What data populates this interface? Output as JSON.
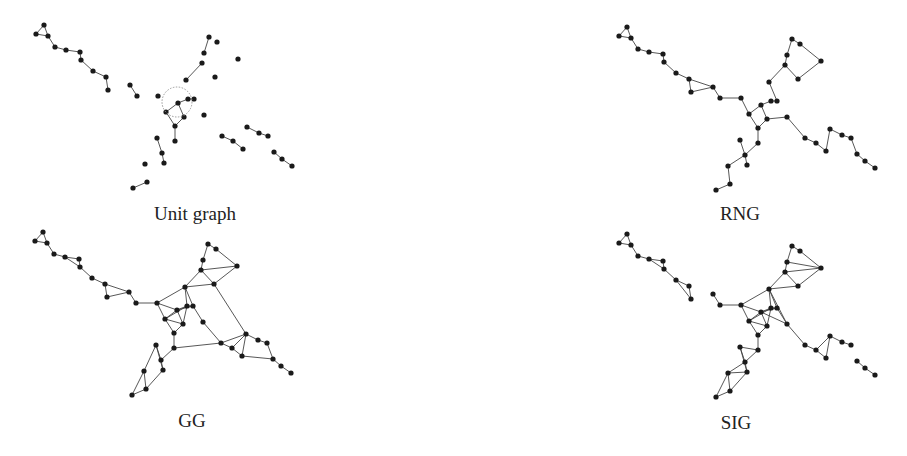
{
  "panels": [
    {
      "id": "unit",
      "label": "Unit graph",
      "label_pos": [
        195,
        203
      ],
      "offset": [
        -583,
        -2
      ]
    },
    {
      "id": "rng",
      "label": "RNG",
      "label_pos": [
        740,
        203
      ],
      "offset": [
        0,
        0
      ]
    },
    {
      "id": "gg",
      "label": "GG",
      "label_pos": [
        192,
        410
      ],
      "offset": [
        -584,
        205
      ]
    },
    {
      "id": "sig",
      "label": "SIG",
      "label_pos": [
        736,
        412
      ],
      "offset": [
        0,
        207
      ]
    }
  ],
  "points": [
    [
      627,
      27
    ],
    [
      619,
      36
    ],
    [
      631,
      38
    ],
    [
      638,
      49
    ],
    [
      649,
      52
    ],
    [
      663,
      54
    ],
    [
      664,
      62
    ],
    [
      676,
      73
    ],
    [
      689,
      79
    ],
    [
      691,
      92
    ],
    [
      713,
      87
    ],
    [
      720,
      98
    ],
    [
      741,
      98
    ],
    [
      749,
      114
    ],
    [
      761,
      105
    ],
    [
      771,
      101
    ],
    [
      777,
      101
    ],
    [
      769,
      82
    ],
    [
      785,
      65
    ],
    [
      787,
      55
    ],
    [
      792,
      39
    ],
    [
      800,
      44
    ],
    [
      821,
      61
    ],
    [
      798,
      79
    ],
    [
      767,
      119
    ],
    [
      758,
      128
    ],
    [
      787,
      117
    ],
    [
      805,
      138
    ],
    [
      816,
      143
    ],
    [
      826,
      151
    ],
    [
      830,
      129
    ],
    [
      842,
      135
    ],
    [
      851,
      138
    ],
    [
      857,
      154
    ],
    [
      865,
      161
    ],
    [
      875,
      168
    ],
    [
      758,
      143
    ],
    [
      745,
      155
    ],
    [
      740,
      140
    ],
    [
      747,
      165
    ],
    [
      728,
      166
    ],
    [
      730,
      184
    ],
    [
      716,
      190
    ]
  ],
  "edges": {
    "unit": [
      [
        0,
        1
      ],
      [
        1,
        2
      ],
      [
        0,
        2
      ],
      [
        2,
        3
      ],
      [
        3,
        4
      ],
      [
        4,
        5
      ],
      [
        5,
        6
      ],
      [
        6,
        7
      ],
      [
        7,
        8
      ],
      [
        8,
        9
      ],
      [
        10,
        11
      ],
      [
        19,
        20
      ],
      [
        17,
        18
      ],
      [
        14,
        15
      ],
      [
        15,
        16
      ],
      [
        13,
        14
      ],
      [
        13,
        25
      ],
      [
        14,
        24
      ],
      [
        24,
        25
      ],
      [
        25,
        36
      ],
      [
        38,
        37
      ],
      [
        37,
        39
      ],
      [
        41,
        42
      ],
      [
        27,
        28
      ],
      [
        28,
        29
      ],
      [
        30,
        31
      ],
      [
        31,
        32
      ],
      [
        33,
        34
      ],
      [
        34,
        35
      ]
    ],
    "rng": [
      [
        0,
        1
      ],
      [
        1,
        2
      ],
      [
        0,
        2
      ],
      [
        2,
        3
      ],
      [
        3,
        4
      ],
      [
        4,
        5
      ],
      [
        5,
        6
      ],
      [
        6,
        7
      ],
      [
        7,
        8
      ],
      [
        8,
        9
      ],
      [
        9,
        10
      ],
      [
        8,
        10
      ],
      [
        10,
        11
      ],
      [
        11,
        12
      ],
      [
        12,
        13
      ],
      [
        13,
        14
      ],
      [
        14,
        15
      ],
      [
        15,
        16
      ],
      [
        16,
        17
      ],
      [
        17,
        18
      ],
      [
        18,
        19
      ],
      [
        19,
        20
      ],
      [
        18,
        23
      ],
      [
        23,
        22
      ],
      [
        22,
        21
      ],
      [
        21,
        20
      ],
      [
        14,
        24
      ],
      [
        13,
        25
      ],
      [
        24,
        25
      ],
      [
        24,
        26
      ],
      [
        26,
        27
      ],
      [
        27,
        28
      ],
      [
        28,
        29
      ],
      [
        29,
        30
      ],
      [
        30,
        31
      ],
      [
        31,
        32
      ],
      [
        32,
        33
      ],
      [
        33,
        34
      ],
      [
        34,
        35
      ],
      [
        25,
        36
      ],
      [
        36,
        37
      ],
      [
        37,
        38
      ],
      [
        37,
        39
      ],
      [
        37,
        40
      ],
      [
        40,
        41
      ],
      [
        41,
        42
      ]
    ],
    "gg": [
      [
        0,
        1
      ],
      [
        1,
        2
      ],
      [
        0,
        2
      ],
      [
        2,
        3
      ],
      [
        3,
        4
      ],
      [
        4,
        5
      ],
      [
        4,
        6
      ],
      [
        5,
        6
      ],
      [
        6,
        7
      ],
      [
        7,
        8
      ],
      [
        8,
        9
      ],
      [
        8,
        10
      ],
      [
        9,
        10
      ],
      [
        10,
        11
      ],
      [
        11,
        12
      ],
      [
        12,
        17
      ],
      [
        12,
        13
      ],
      [
        12,
        14
      ],
      [
        13,
        14
      ],
      [
        13,
        15
      ],
      [
        14,
        15
      ],
      [
        15,
        16
      ],
      [
        14,
        16
      ],
      [
        16,
        17
      ],
      [
        15,
        17
      ],
      [
        17,
        18
      ],
      [
        17,
        23
      ],
      [
        18,
        23
      ],
      [
        18,
        19
      ],
      [
        19,
        20
      ],
      [
        20,
        21
      ],
      [
        18,
        22
      ],
      [
        21,
        22
      ],
      [
        22,
        23
      ],
      [
        23,
        30
      ],
      [
        13,
        24
      ],
      [
        14,
        24
      ],
      [
        24,
        25
      ],
      [
        13,
        25
      ],
      [
        15,
        24
      ],
      [
        16,
        26
      ],
      [
        26,
        27
      ],
      [
        25,
        36
      ],
      [
        36,
        27
      ],
      [
        27,
        28
      ],
      [
        28,
        30
      ],
      [
        27,
        30
      ],
      [
        28,
        29
      ],
      [
        29,
        30
      ],
      [
        30,
        31
      ],
      [
        31,
        32
      ],
      [
        32,
        33
      ],
      [
        29,
        33
      ],
      [
        33,
        34
      ],
      [
        34,
        35
      ],
      [
        36,
        37
      ],
      [
        37,
        38
      ],
      [
        38,
        39
      ],
      [
        37,
        39
      ],
      [
        38,
        40
      ],
      [
        40,
        41
      ],
      [
        41,
        42
      ],
      [
        40,
        42
      ],
      [
        39,
        41
      ]
    ],
    "sig": [
      [
        0,
        1
      ],
      [
        1,
        2
      ],
      [
        0,
        2
      ],
      [
        2,
        3
      ],
      [
        3,
        4
      ],
      [
        4,
        5
      ],
      [
        4,
        6
      ],
      [
        5,
        6
      ],
      [
        6,
        7
      ],
      [
        7,
        8
      ],
      [
        7,
        9
      ],
      [
        8,
        9
      ],
      [
        10,
        11
      ],
      [
        11,
        12
      ],
      [
        12,
        17
      ],
      [
        12,
        13
      ],
      [
        12,
        14
      ],
      [
        13,
        14
      ],
      [
        13,
        15
      ],
      [
        14,
        15
      ],
      [
        15,
        16
      ],
      [
        14,
        16
      ],
      [
        16,
        17
      ],
      [
        15,
        17
      ],
      [
        17,
        18
      ],
      [
        17,
        23
      ],
      [
        18,
        23
      ],
      [
        18,
        19
      ],
      [
        19,
        20
      ],
      [
        20,
        21
      ],
      [
        18,
        22
      ],
      [
        21,
        22
      ],
      [
        22,
        23
      ],
      [
        19,
        22
      ],
      [
        13,
        24
      ],
      [
        14,
        24
      ],
      [
        24,
        25
      ],
      [
        13,
        25
      ],
      [
        15,
        24
      ],
      [
        16,
        26
      ],
      [
        17,
        26
      ],
      [
        14,
        26
      ],
      [
        26,
        27
      ],
      [
        25,
        36
      ],
      [
        36,
        38
      ],
      [
        38,
        37
      ],
      [
        37,
        39
      ],
      [
        38,
        39
      ],
      [
        36,
        37
      ],
      [
        37,
        40
      ],
      [
        39,
        40
      ],
      [
        40,
        41
      ],
      [
        41,
        42
      ],
      [
        40,
        42
      ],
      [
        39,
        41
      ],
      [
        27,
        28
      ],
      [
        28,
        30
      ],
      [
        28,
        29
      ],
      [
        29,
        30
      ],
      [
        30,
        31
      ],
      [
        31,
        32
      ],
      [
        33,
        34
      ],
      [
        34,
        35
      ]
    ]
  }
}
